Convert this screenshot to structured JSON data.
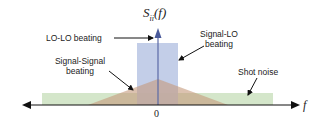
{
  "diagram": {
    "y_axis_label_main": "S",
    "y_axis_label_sub": "ii",
    "y_axis_label_arg": "(f)",
    "x_axis_label": "f",
    "origin_label": "0",
    "components": [
      {
        "id": "lo-lo",
        "label": "LO-LO beating",
        "shape": "delta spike at f=0",
        "color": "#4a5a9a"
      },
      {
        "id": "signal-lo",
        "label_line1": "Signal-LO",
        "label_line2": "beating",
        "shape": "rectangle",
        "color": "#b8c6e6"
      },
      {
        "id": "signal-signal",
        "label_line1": "Signal-Signal",
        "label_line2": "beating",
        "shape": "triangle",
        "color": "#c9a58a"
      },
      {
        "id": "shot-noise",
        "label": "Shot noise",
        "shape": "wide flat rectangle",
        "color": "#cfe3c4"
      }
    ]
  }
}
